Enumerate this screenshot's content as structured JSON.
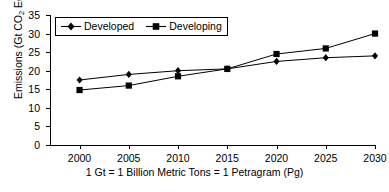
{
  "chart_data": {
    "type": "line",
    "title": "",
    "xlabel": "1 Gt = 1 Billion Metric Tons = 1 Petragram (Pg)",
    "ylabel": "Emissions (Gt CO2 Equivalent)",
    "ylabel_parts": {
      "prefix": "Emissions (Gt CO",
      "sub": "2",
      "suffix": " Equivalent)"
    },
    "x": [
      2000,
      2005,
      2010,
      2015,
      2020,
      2025,
      2030
    ],
    "categories": [
      "2000",
      "2005",
      "2010",
      "2015",
      "2020",
      "2025",
      "2030"
    ],
    "xlim": [
      1997,
      2030
    ],
    "ylim": [
      0,
      35
    ],
    "yticks": [
      0,
      5,
      10,
      15,
      20,
      25,
      30,
      35
    ],
    "ytick_labels": [
      "0",
      "5",
      "10",
      "15",
      "20",
      "25",
      "30",
      "35"
    ],
    "grid": false,
    "legend_position": "top-left-inside",
    "series": [
      {
        "name": "Developed",
        "marker": "diamond",
        "color": "#000000",
        "values": [
          17.5,
          19.0,
          20.0,
          20.5,
          22.5,
          23.5,
          24.0
        ]
      },
      {
        "name": "Developing",
        "marker": "square",
        "color": "#000000",
        "values": [
          14.8,
          16.0,
          18.5,
          20.5,
          24.5,
          26.0,
          30.0
        ]
      }
    ]
  },
  "legend": {
    "entries": [
      {
        "label": "Developed",
        "marker": "diamond"
      },
      {
        "label": "Developing",
        "marker": "square"
      }
    ]
  },
  "colors": {
    "axis": "#000000",
    "series": "#000000",
    "background": "#ffffff"
  }
}
